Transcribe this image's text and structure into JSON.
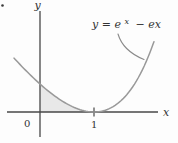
{
  "figure": {
    "corner_dot_present": true
  },
  "chart_data": {
    "type": "line",
    "title": "",
    "function_label": {
      "full_text": "y = e^x − ex",
      "prefix": "y = e",
      "superscript": "x",
      "suffix": "− ex"
    },
    "xlabel": "x",
    "ylabel": "y",
    "origin_label": "0",
    "x_ticks": [
      {
        "value": 1,
        "label": "1"
      }
    ],
    "series": [
      {
        "name": "y = e^x − ex",
        "function": "exp(x) - e*x",
        "domain": [
          -0.48,
          2.11
        ],
        "key_points": [
          {
            "x": 0,
            "y": 1,
            "desc": "y-intercept"
          },
          {
            "x": 1,
            "y": 0,
            "desc": "minimum, curve touches x-axis"
          }
        ]
      }
    ],
    "shaded_region": {
      "from_x": 0,
      "to_x": 1,
      "desc": "area bounded by curve, x-axis and y-axis"
    },
    "axis_ranges": {
      "x_visible": [
        -0.61,
        2.18
      ],
      "y_visible": [
        -0.9,
        3.6
      ]
    },
    "grid": "off",
    "legend": "none",
    "colors": {
      "curve": "#999999",
      "axis": "#474747",
      "text": "#333333",
      "leader": "#8a8a8a",
      "shade": "#e8e8e8",
      "background": "#fdfdfd"
    },
    "plot": {
      "origin_px": [
        40,
        112
      ],
      "px_per_unit_x": 54,
      "px_per_unit_y": 28,
      "samples": 72
    }
  }
}
